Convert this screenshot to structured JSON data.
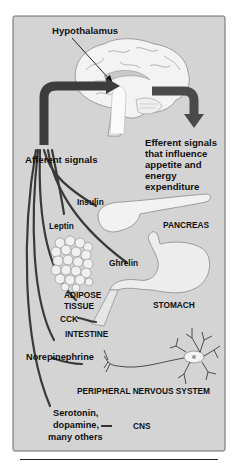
{
  "figure": {
    "type": "physiology-diagram",
    "background": "#d4d4d4",
    "panel_border": "#6a6a6a",
    "arrow_color": "#3c3c3c",
    "organ_fill": "#f2f2f2"
  },
  "labels": {
    "hypothalamus": "Hypothalamus",
    "afferent": "Afferent signals",
    "efferent": [
      "Efferent signals",
      "that influence",
      "appetite and",
      "energy",
      "expenditure"
    ],
    "insulin": "Insulin",
    "pancreas": "PANCREAS",
    "leptin": "Leptin",
    "adipose": [
      "ADIPOSE",
      "TISSUE"
    ],
    "ghrelin": "Ghrelin",
    "stomach": "STOMACH",
    "cck": "CCK",
    "intestine": "INTESTINE",
    "norepinephrine": "Norepinephrine",
    "pns": "PERIPHERAL NERVOUS SYSTEM",
    "cns_signals": [
      "Serotonin,",
      "dopamine,",
      "many others"
    ],
    "cns": "CNS"
  },
  "signals": [
    {
      "name": "Insulin",
      "source": "PANCREAS"
    },
    {
      "name": "Leptin",
      "source": "ADIPOSE TISSUE"
    },
    {
      "name": "Ghrelin",
      "source": "STOMACH"
    },
    {
      "name": "CCK",
      "source": "INTESTINE"
    },
    {
      "name": "Norepinephrine",
      "source": "PERIPHERAL NERVOUS SYSTEM"
    },
    {
      "name": "Serotonin, dopamine, many others",
      "source": "CNS"
    }
  ]
}
